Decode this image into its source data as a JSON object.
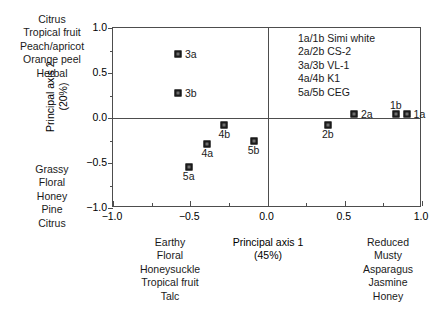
{
  "chart_data": {
    "type": "scatter",
    "title": "",
    "xlabel": "Principal axis 1",
    "xlabel_sub": "(45%)",
    "ylabel": "Principal axis 2",
    "ylabel_sub": "(20%)",
    "ylabel_full": "Principal axis 2 (20%)",
    "xlim": [
      -1.0,
      1.0
    ],
    "ylim": [
      -1.0,
      1.0
    ],
    "grid": false,
    "zero_lines": true,
    "legend_position": "upper-right-inside",
    "xticks": [
      -1.0,
      -0.5,
      0.0,
      0.5,
      1.0
    ],
    "xtick_labels": [
      "−1.0",
      "−0.5",
      "0.0",
      "0.5",
      "1.0"
    ],
    "xticks_minor": [
      -0.75,
      -0.25,
      0.25,
      0.75
    ],
    "yticks": [
      -1.0,
      -0.5,
      0.0,
      0.5,
      1.0
    ],
    "ytick_labels": [
      "−1.0",
      "−0.5",
      "0.0",
      "0.5",
      "1.0"
    ],
    "yticks_minor": [
      -0.75,
      -0.25,
      0.25,
      0.75
    ],
    "points": [
      {
        "label": "3a",
        "x": -0.58,
        "y": 0.71,
        "label_dx": 7,
        "label_dy": -6
      },
      {
        "label": "3b",
        "x": -0.58,
        "y": 0.28,
        "label_dx": 7,
        "label_dy": -6
      },
      {
        "label": "4b",
        "x": -0.28,
        "y": -0.08,
        "label_dx": -7,
        "label_dy": 3
      },
      {
        "label": "4a",
        "x": -0.39,
        "y": -0.29,
        "label_dx": -7,
        "label_dy": 3
      },
      {
        "label": "5b",
        "x": -0.09,
        "y": -0.26,
        "label_dx": -7,
        "label_dy": 3
      },
      {
        "label": "5a",
        "x": -0.51,
        "y": -0.54,
        "label_dx": -7,
        "label_dy": 3
      },
      {
        "label": "2a",
        "x": 0.56,
        "y": 0.04,
        "label_dx": 7,
        "label_dy": -6
      },
      {
        "label": "2b",
        "x": 0.39,
        "y": -0.08,
        "label_dx": -7,
        "label_dy": 3
      },
      {
        "label": "1b",
        "x": 0.83,
        "y": 0.04,
        "label_dx": -7,
        "label_dy": -15
      },
      {
        "label": "1a",
        "x": 0.9,
        "y": 0.04,
        "label_dx": 7,
        "label_dy": -6
      }
    ],
    "legend_entries": [
      "1a/1b Simi white",
      "2a/2b CS-2",
      "3a/3b VL-1",
      "4a/4b K1",
      "5a/5b CEG"
    ],
    "annotations": {
      "top_left": [
        "Citrus",
        "Tropical fruit",
        "Peach/apricot",
        "Orange peel",
        "Herbal"
      ],
      "bottom_left": [
        "Grassy",
        "Floral",
        "Honey",
        "Pine",
        "Citrus"
      ],
      "bottom_center": [
        "Earthy",
        "Floral",
        "Honeysuckle",
        "Tropical fruit",
        "Talc"
      ],
      "bottom_right": [
        "Reduced",
        "Musty",
        "Asparagus",
        "Jasmine",
        "Honey"
      ]
    },
    "colors": {
      "marker_outer": "#1a1a1a",
      "marker_inner": "#6e6e6e",
      "axis": "#4d4d4d",
      "text": "#1a1a1a",
      "background": "#ffffff"
    }
  }
}
